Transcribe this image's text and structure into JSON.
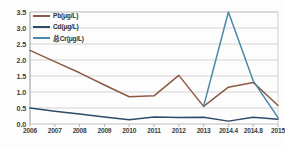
{
  "chart_data": {
    "type": "line",
    "title": "",
    "xlabel": "",
    "ylabel": "",
    "categories": [
      "2006",
      "2007",
      "2008",
      "2009",
      "2010",
      "2011",
      "2012",
      "2013",
      "2014.4",
      "2014.8",
      "2015"
    ],
    "ylim": [
      0.0,
      3.5
    ],
    "yticks": [
      "0.0",
      "0.5",
      "1.0",
      "1.5",
      "2.0",
      "2.5",
      "3.0",
      "3.5"
    ],
    "ytick_values": [
      0.0,
      0.5,
      1.0,
      1.5,
      2.0,
      2.5,
      3.0,
      3.5
    ],
    "grid": "horizontal",
    "legend_position": "upper-left-inside",
    "series": [
      {
        "name": "Pb(μg/L)",
        "color": "#8a5a44",
        "values": [
          2.3,
          1.95,
          1.6,
          1.22,
          0.85,
          0.88,
          1.52,
          0.55,
          1.15,
          1.3,
          0.58
        ]
      },
      {
        "name": "Cd(μg/L)",
        "color": "#2e4a6b",
        "values": [
          0.5,
          0.4,
          0.31,
          0.22,
          0.13,
          0.22,
          0.2,
          0.21,
          0.09,
          0.21,
          0.15
        ]
      },
      {
        "name": "总Cr(μg/L)",
        "color": "#4a89a8",
        "values": [
          0.5,
          null,
          null,
          null,
          null,
          null,
          null,
          0.55,
          3.5,
          1.35,
          0.2
        ]
      }
    ]
  },
  "colors": {
    "grid": "#bfbfbf",
    "axis": "#9a9a9a",
    "plot_background": "#ffffff",
    "page_background": "#fdfdfd",
    "tick_text": "#3d3d3d"
  }
}
